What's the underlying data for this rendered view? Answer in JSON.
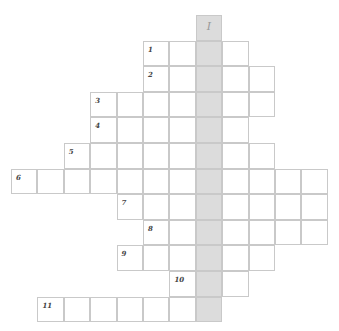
{
  "puzzle": {
    "title_cropped": "",
    "highlight_label": "I",
    "highlight_column": 7,
    "colors": {
      "border": "#c9c9c9",
      "highlight": "#dcdcdc",
      "background": "#ffffff"
    },
    "layout": {
      "origin_x": 11,
      "origin_y": 15,
      "cell_w": 26.4,
      "cell_h": 25.6
    },
    "rows": [
      {
        "row": 0,
        "number": "",
        "start_col": 7,
        "end_col": 7
      },
      {
        "row": 1,
        "number": "1",
        "start_col": 5,
        "end_col": 8
      },
      {
        "row": 2,
        "number": "2",
        "start_col": 5,
        "end_col": 9
      },
      {
        "row": 3,
        "number": "3",
        "start_col": 3,
        "end_col": 9
      },
      {
        "row": 4,
        "number": "4",
        "start_col": 3,
        "end_col": 8
      },
      {
        "row": 5,
        "number": "5",
        "start_col": 2,
        "end_col": 9
      },
      {
        "row": 6,
        "number": "6",
        "start_col": 0,
        "end_col": 11
      },
      {
        "row": 7,
        "number": "7",
        "start_col": 4,
        "end_col": 11
      },
      {
        "row": 8,
        "number": "8",
        "start_col": 5,
        "end_col": 11
      },
      {
        "row": 9,
        "number": "9",
        "start_col": 4,
        "end_col": 9
      },
      {
        "row": 10,
        "number": "10",
        "start_col": 6,
        "end_col": 8
      },
      {
        "row": 11,
        "number": "11",
        "start_col": 1,
        "end_col": 7
      }
    ]
  }
}
